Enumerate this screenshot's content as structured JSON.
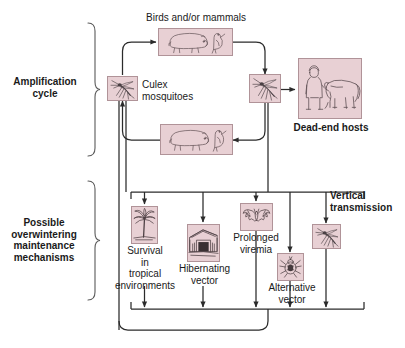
{
  "diagram": {
    "colors": {
      "image_fill": "#e8d0d4",
      "image_border": "#b09398",
      "line": "#2b2b2b",
      "text": "#1a1a1a"
    }
  },
  "sections": [
    {
      "id": "amplification",
      "label": "Amplification\ncycle"
    },
    {
      "id": "overwintering",
      "label": "Possible\noverwintering\nmaintenance\nmechanisms"
    }
  ],
  "nodes": [
    {
      "id": "birds-mammals-top",
      "label": "Birds and/or mammals",
      "label_position": "above",
      "icon": "pig-and-heron-icon"
    },
    {
      "id": "culex",
      "label": "Culex\nmosquitoes",
      "label_position": "right",
      "icon": "mosquito-icon"
    },
    {
      "id": "birds-mammals-bottom",
      "label": "",
      "label_position": "none",
      "icon": "pig-and-heron-icon"
    },
    {
      "id": "vector-mosquito",
      "label": "",
      "label_position": "none",
      "icon": "mosquito-icon"
    },
    {
      "id": "dead-end-hosts",
      "label": "Dead-end hosts",
      "label_position": "below",
      "icon": "person-and-horse-icon"
    },
    {
      "id": "tropical-survival",
      "label": "Survival\nin\ntropical\nenvironments",
      "label_position": "below",
      "icon": "palm-tree-icon"
    },
    {
      "id": "hibernating-vector",
      "label": "Hibernating\nvector",
      "label_position": "below",
      "icon": "barn-shed-icon"
    },
    {
      "id": "prolonged-viremia",
      "label": "Prolonged\nviremia",
      "label_position": "below",
      "icon": "bat-icon"
    },
    {
      "id": "alternative-vector",
      "label": "Alternative\nvector",
      "label_position": "below",
      "icon": "tick-icon"
    },
    {
      "id": "vertical-transmission",
      "label": "Vertical\ntransmission",
      "label_position": "above",
      "icon": "mosquito-icon"
    }
  ]
}
